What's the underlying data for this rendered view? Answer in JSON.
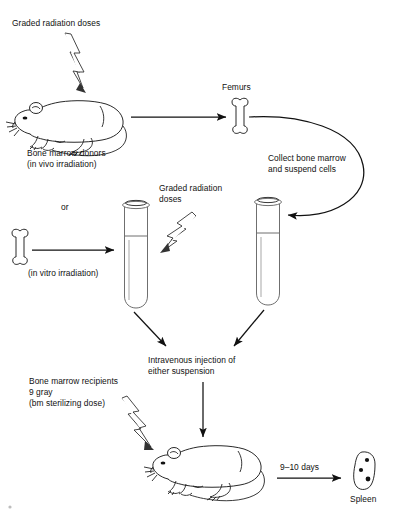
{
  "figure": {
    "type": "flow-diagram"
  },
  "labels": {
    "graded_doses_top": "Graded radiation doses",
    "donors_line1": "Bone marrow donors",
    "donors_line2": "(in vivo irradiation)",
    "femurs": "Femurs",
    "collect_line1": "Collect bone marrow",
    "collect_line2": "and suspend cells",
    "or": "or",
    "graded_doses_mid_line1": "Graded radiation",
    "graded_doses_mid_line2": "doses",
    "in_vitro": "(in vitro irradiation)",
    "injection_line1": "Intravenous injection of",
    "injection_line2": "either suspension",
    "recipients_line1": "Bone marrow recipients",
    "recipients_line2": "9 gray",
    "recipients_line3": "(bm sterilizing dose)",
    "days": "9–10 days",
    "spleen": "Spleen"
  },
  "icons": {
    "mouse_donor": "mouse-icon",
    "mouse_recipient": "mouse-icon",
    "femur_top": "bone-icon",
    "femur_left": "bone-icon",
    "tube_left": "test-tube-icon",
    "tube_right": "test-tube-icon",
    "spleen": "spleen-icon",
    "radiation_top": "lightning-bolt-icon",
    "radiation_mid": "lightning-bolt-icon",
    "radiation_bottom": "lightning-bolt-icon"
  },
  "colors": {
    "ink": "#111111",
    "fluid": "#e4e4e4",
    "glass": "#6f6f6f"
  },
  "spleen_colonies": 3
}
